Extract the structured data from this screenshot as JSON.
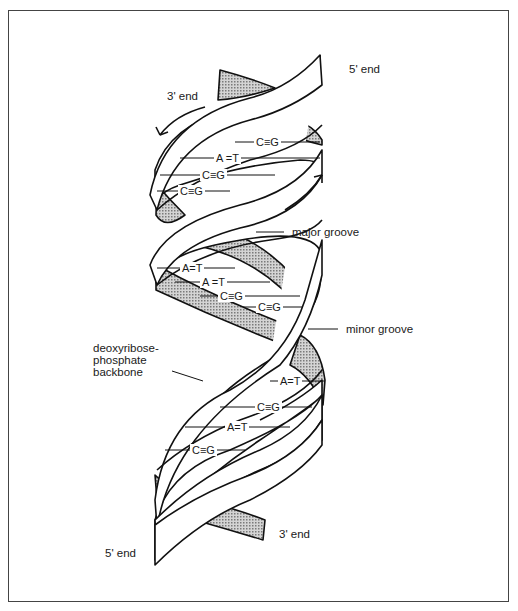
{
  "diagram": {
    "colors": {
      "strand_fill": "#ffffff",
      "back_fill": "#b5b5b5",
      "line": "#111111",
      "frame": "#444444"
    },
    "labels": {
      "top_5_end": "5' end",
      "top_3_end": "3' end",
      "major_groove": "major groove",
      "minor_groove": "minor groove",
      "backbone": [
        "deoxyribose-",
        "phosphate",
        "backbone"
      ],
      "bottom_5_end": "5' end",
      "bottom_3_end": "3' end"
    },
    "base_pairs": [
      {
        "text": "C≡G"
      },
      {
        "text": "A =T"
      },
      {
        "text": "C≡G"
      },
      {
        "text": "C≡G"
      },
      {
        "text": "A=T"
      },
      {
        "text": "A =T"
      },
      {
        "text": "C≡G"
      },
      {
        "text": "C≡G"
      },
      {
        "text": "A=T"
      },
      {
        "text": "C≡G"
      },
      {
        "text": "A=T"
      },
      {
        "text": "C≡G"
      }
    ]
  }
}
